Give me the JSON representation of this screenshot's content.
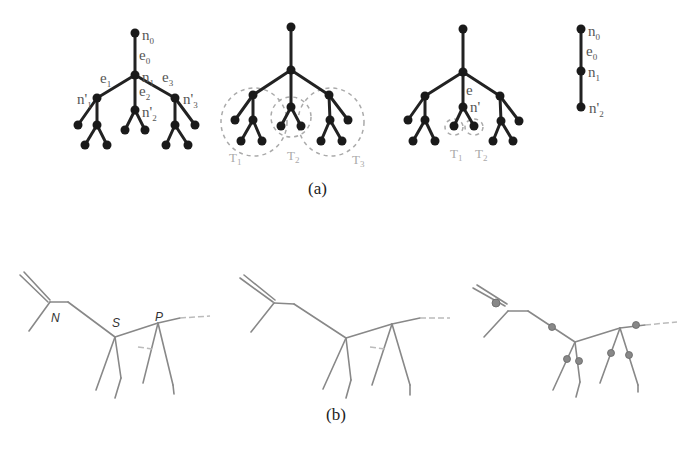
{
  "figure": {
    "panel_a": {
      "caption": "(a)",
      "tree1": {
        "labels": {
          "n0": "n",
          "n0_sub": "0",
          "e0": "e",
          "e0_sub": "0",
          "n1": "n",
          "n1_sub": "1",
          "e1": "e",
          "e1_sub": "1",
          "e2": "e",
          "e2_sub": "2",
          "e3": "e",
          "e3_sub": "3",
          "np1": "n'",
          "np1_sub": "1",
          "np2": "n'",
          "np2_sub": "2",
          "np3": "n'",
          "np3_sub": "3"
        }
      },
      "tree2": {
        "subtree_labels": [
          {
            "label": "T",
            "sub": "1"
          },
          {
            "label": "T",
            "sub": "2"
          },
          {
            "label": "T",
            "sub": "3"
          }
        ]
      },
      "tree3": {
        "labels": {
          "e": "e",
          "n": "n'"
        },
        "subtree_labels": [
          {
            "label": "T",
            "sub": "1"
          },
          {
            "label": "T",
            "sub": "2"
          }
        ]
      },
      "tree4": {
        "labels": {
          "n0": "n",
          "n0_sub": "0",
          "e0": "e",
          "e0_sub": "0",
          "n1": "n",
          "n1_sub": "1",
          "np2": "n'",
          "np2_sub": "2"
        }
      }
    },
    "panel_b": {
      "caption": "(b)",
      "skeleton1": {
        "joint_labels": {
          "neck": "N",
          "shoulder": "S",
          "pelvis": "P"
        }
      }
    }
  }
}
